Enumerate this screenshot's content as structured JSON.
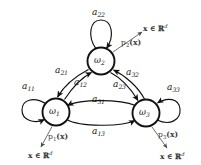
{
  "diagram": {
    "type": "state-transition-diagram",
    "stroke_color": "#111111",
    "background_color": "#ffffff",
    "nodes": [
      {
        "id": "w1",
        "label_base": "ω",
        "label_sub": "1",
        "cx": 56,
        "cy": 112,
        "r": 13.5
      },
      {
        "id": "w2",
        "label_base": "ω",
        "label_sub": "2",
        "cx": 101,
        "cy": 61,
        "r": 13.5
      },
      {
        "id": "w3",
        "label_base": "ω",
        "label_sub": "3",
        "cx": 146,
        "cy": 113,
        "r": 13.5
      }
    ],
    "transitions": [
      {
        "id": "a11",
        "base": "a",
        "sub": "11",
        "from": "w1",
        "to": "w1",
        "kind": "self-loop"
      },
      {
        "id": "a22",
        "base": "a",
        "sub": "22",
        "from": "w2",
        "to": "w2",
        "kind": "self-loop"
      },
      {
        "id": "a33",
        "base": "a",
        "sub": "33",
        "from": "w3",
        "to": "w3",
        "kind": "self-loop"
      },
      {
        "id": "a21",
        "base": "a",
        "sub": "21",
        "from": "w2",
        "to": "w1",
        "kind": "curved"
      },
      {
        "id": "a12",
        "base": "a",
        "sub": "12",
        "from": "w1",
        "to": "w2",
        "kind": "curved"
      },
      {
        "id": "a32",
        "base": "a",
        "sub": "32",
        "from": "w3",
        "to": "w2",
        "kind": "curved"
      },
      {
        "id": "a23",
        "base": "a",
        "sub": "23",
        "from": "w2",
        "to": "w3",
        "kind": "curved"
      },
      {
        "id": "a31",
        "base": "a",
        "sub": "31",
        "from": "w3",
        "to": "w1",
        "kind": "curved"
      },
      {
        "id": "a13",
        "base": "a",
        "sub": "13",
        "from": "w1",
        "to": "w3",
        "kind": "curved"
      }
    ],
    "emissions": [
      {
        "id": "p1",
        "base": "p",
        "sub": "1",
        "arg": "(x)",
        "from": "w1",
        "output": "x ∈ ℝ",
        "output_exp": "d"
      },
      {
        "id": "p2",
        "base": "p",
        "sub": "2",
        "arg": "(x)",
        "from": "w2",
        "output": "x ∈ ℝ",
        "output_exp": "d"
      },
      {
        "id": "p3",
        "base": "p",
        "sub": "3",
        "arg": "(x)",
        "from": "w3",
        "output": "x ∈ ℝ",
        "output_exp": "d"
      }
    ]
  }
}
